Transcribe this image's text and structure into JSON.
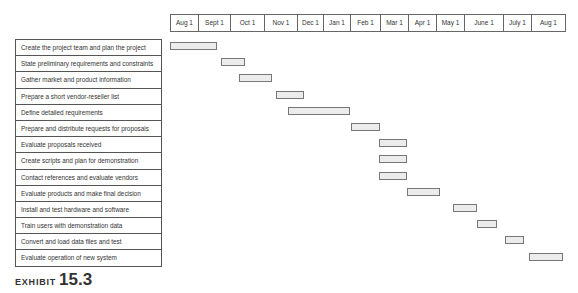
{
  "chart_data": {
    "type": "gantt",
    "title": "",
    "caption": "EXHIBIT 15.3",
    "timeline_headers": [
      "Aug 1",
      "Sept 1",
      "Oct 1",
      "Nov 1",
      "Dec 1",
      "Jan 1",
      "Feb 1",
      "Mar 1",
      "Apr 1",
      "May 1",
      "June 1",
      "July 1",
      "Aug 1"
    ],
    "tasks": [
      {
        "name": "Create the project team and plan the project",
        "start": "Aug 1",
        "end": "Sept 15"
      },
      {
        "name": "State preliminary requirements and constraints",
        "start": "Sept 20",
        "end": "Oct 15"
      },
      {
        "name": "Gather market and product information",
        "start": "Oct 5",
        "end": "Nov 5"
      },
      {
        "name": "Prepare a short vendor-reseller list",
        "start": "Nov 10",
        "end": "Dec 5"
      },
      {
        "name": "Define detailed requirements",
        "start": "Nov 25",
        "end": "Jan 25"
      },
      {
        "name": "Prepare and distribute requests for proposals",
        "start": "Feb 1",
        "end": "Mar 1"
      },
      {
        "name": "Evaluate proposals received",
        "start": "Mar 1",
        "end": "Apr 1"
      },
      {
        "name": "Create scripts and plan for demonstration",
        "start": "Mar 1",
        "end": "Apr 1"
      },
      {
        "name": "Contact references and evaluate vendors",
        "start": "Mar 1",
        "end": "Apr 1"
      },
      {
        "name": "Evaluate products and make final decision",
        "start": "Apr 1",
        "end": "May 5"
      },
      {
        "name": "Install and test hardware and software",
        "start": "May 20",
        "end": "June 15"
      },
      {
        "name": "Train users with demonstration data",
        "start": "June 15",
        "end": "July 1"
      },
      {
        "name": "Convert and load data files and test",
        "start": "July 1",
        "end": "July 20"
      },
      {
        "name": "Evaluate operation of new system",
        "start": "July 25",
        "end": "Aug 31"
      }
    ]
  },
  "layout": {
    "header_cells": [
      {
        "label": "Aug 1",
        "x": 170,
        "w": 28
      },
      {
        "label": "Sept 1",
        "x": 198,
        "w": 32
      },
      {
        "label": "Oct 1",
        "x": 230,
        "w": 34
      },
      {
        "label": "Nov 1",
        "x": 264,
        "w": 33
      },
      {
        "label": "Dec 1",
        "x": 297,
        "w": 26
      },
      {
        "label": "Jan 1",
        "x": 323,
        "w": 27
      },
      {
        "label": "Feb 1",
        "x": 350,
        "w": 30
      },
      {
        "label": "Mar 1",
        "x": 380,
        "w": 28
      },
      {
        "label": "Apr 1",
        "x": 408,
        "w": 28
      },
      {
        "label": "May 1",
        "x": 436,
        "w": 28
      },
      {
        "label": "June 1",
        "x": 464,
        "w": 39
      },
      {
        "label": "July 1",
        "x": 503,
        "w": 28
      },
      {
        "label": "Aug 1",
        "x": 531,
        "w": 34
      }
    ],
    "bars": [
      {
        "x": 170,
        "w": 47
      },
      {
        "x": 221,
        "w": 24
      },
      {
        "x": 239,
        "w": 33
      },
      {
        "x": 276,
        "w": 28
      },
      {
        "x": 288,
        "w": 62
      },
      {
        "x": 351,
        "w": 29
      },
      {
        "x": 379,
        "w": 28
      },
      {
        "x": 379,
        "w": 28
      },
      {
        "x": 379,
        "w": 28
      },
      {
        "x": 407,
        "w": 33
      },
      {
        "x": 453,
        "w": 24
      },
      {
        "x": 477,
        "w": 20
      },
      {
        "x": 505,
        "w": 19
      },
      {
        "x": 529,
        "w": 34
      }
    ]
  },
  "caption": {
    "prefix": "EXHIBIT",
    "number": "15.3"
  }
}
